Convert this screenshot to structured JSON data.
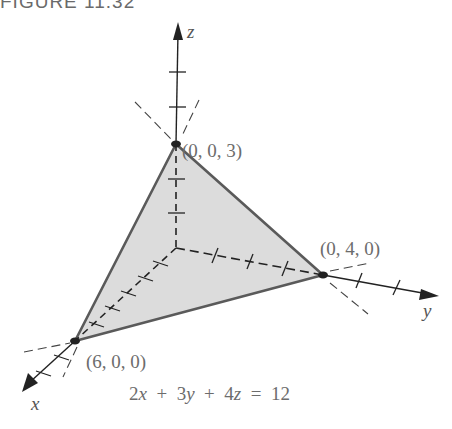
{
  "figure": {
    "title": "FIGURE 11.32",
    "equation": "2x + 3y + 4z = 12",
    "plane": {
      "equation_terms": {
        "x_coef": 2,
        "y_coef": 3,
        "z_coef": 4,
        "rhs": 12
      },
      "fill_color": "#dcdcdc",
      "edge_color": "#555555"
    },
    "axes": {
      "x": {
        "label": "x"
      },
      "y": {
        "label": "y"
      },
      "z": {
        "label": "z"
      }
    },
    "vertices": [
      {
        "name": "z-intercept",
        "label": "(0, 0, 3)"
      },
      {
        "name": "y-intercept",
        "label": "(0, 4, 0)"
      },
      {
        "name": "x-intercept",
        "label": "(6, 0, 0)"
      }
    ]
  }
}
